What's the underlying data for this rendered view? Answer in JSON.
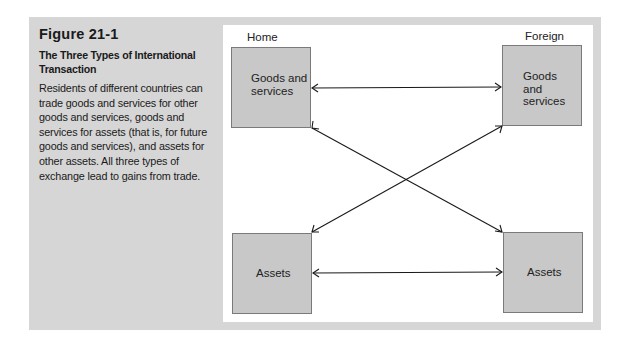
{
  "caption": {
    "figure_number": "Figure 21-1",
    "title": "The Three Types of International Transaction",
    "description": "Residents of different countries can trade goods and services for other goods and services, goods and services for assets (that is, for future goods and services), and assets for other assets. All three types of exchange lead to gains from trade."
  },
  "diagram": {
    "columns": {
      "home": "Home",
      "foreign": "Foreign"
    },
    "nodes": {
      "home_goods": "Goods and services",
      "home_assets": "Assets",
      "foreign_goods": "Goods and services",
      "foreign_assets": "Assets"
    },
    "edges": [
      {
        "from": "home_goods",
        "to": "foreign_goods",
        "type": "bidirectional"
      },
      {
        "from": "home_assets",
        "to": "foreign_assets",
        "type": "bidirectional"
      },
      {
        "from": "home_goods",
        "to": "foreign_assets",
        "type": "bidirectional"
      },
      {
        "from": "home_assets",
        "to": "foreign_goods",
        "type": "bidirectional"
      }
    ],
    "colors": {
      "frame": "#d6d6d6",
      "box_fill": "#c8c8c8",
      "box_border": "#7a7a7a",
      "arrow": "#1a1a1a"
    }
  }
}
